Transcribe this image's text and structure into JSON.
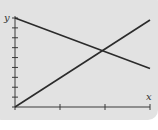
{
  "chart_data": {
    "type": "line",
    "title": "",
    "xlabel": "x",
    "ylabel": "y",
    "xlim": [
      0,
      3
    ],
    "ylim": [
      0,
      9
    ],
    "x_ticks": [
      0,
      1,
      2,
      3
    ],
    "y_ticks": [
      0,
      1,
      2,
      3,
      4,
      5,
      6,
      7,
      8,
      9
    ],
    "tick_labels_shown": false,
    "grid": false,
    "legend": null,
    "series": [
      {
        "name": "decreasing line",
        "x": [
          0,
          3
        ],
        "y": [
          9,
          3.9
        ]
      },
      {
        "name": "increasing line",
        "x": [
          0,
          3
        ],
        "y": [
          0,
          8.8
        ]
      }
    ],
    "annotations": [
      {
        "type": "intersection",
        "x": 1.9,
        "y": 6
      }
    ]
  },
  "colors": {
    "panel_background": "#e2e2e2",
    "line": "#2b2b2b",
    "axis": "#3a3a3a",
    "page_background": "#ffffff"
  },
  "labels": {
    "x_axis": "x",
    "y_axis": "y"
  }
}
